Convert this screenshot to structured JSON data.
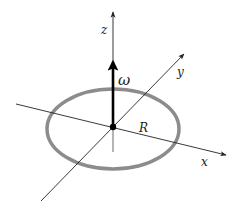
{
  "diagram": {
    "type": "3d-axes-ring",
    "axes": {
      "x": {
        "label": "x"
      },
      "y": {
        "label": "y"
      },
      "z": {
        "label": "z"
      }
    },
    "angular_velocity": {
      "label": "ω"
    },
    "ring": {
      "radius_label": "R"
    },
    "colors": {
      "axis": "#222222",
      "ring": "#8c8c8c",
      "omega_arrow": "#000000",
      "hidden_axis": "#8c8c8c"
    }
  }
}
